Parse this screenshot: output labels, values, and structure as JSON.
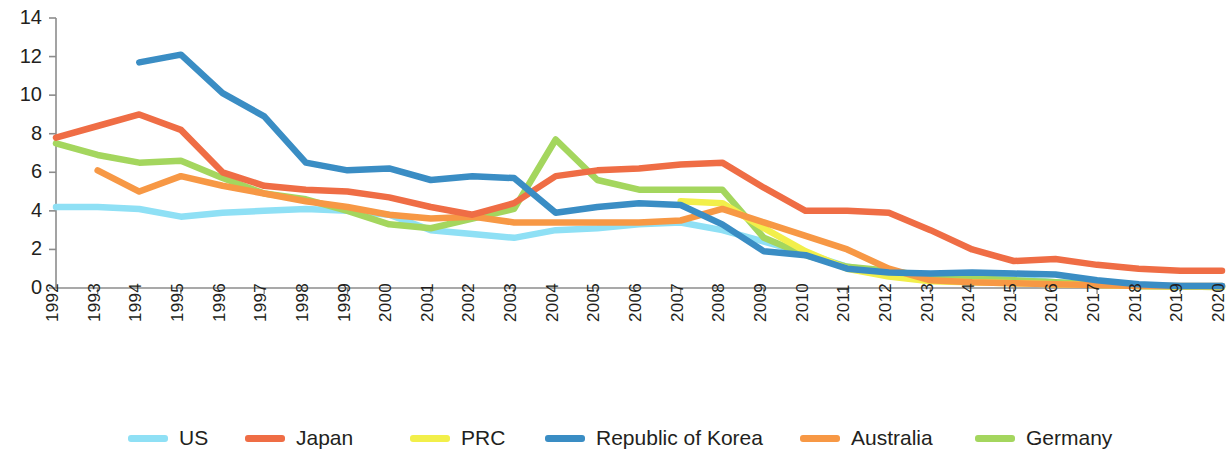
{
  "chart_data": {
    "type": "line",
    "title": "",
    "xlabel": "",
    "ylabel": "",
    "grid": false,
    "legend_position": "bottom",
    "ylim": [
      0,
      14
    ],
    "yticks": [
      0,
      2,
      4,
      6,
      8,
      10,
      12,
      14
    ],
    "categories": [
      "1992",
      "1993",
      "1994",
      "1995",
      "1996",
      "1997",
      "1998",
      "1999",
      "2000",
      "2001",
      "2002",
      "2003",
      "2004",
      "2005",
      "2006",
      "2007",
      "2008",
      "2009",
      "2010",
      "2011",
      "2012",
      "2013",
      "2014",
      "2015",
      "2016",
      "2017",
      "2018",
      "2019",
      "2020"
    ],
    "series": [
      {
        "name": "US",
        "color": "#8FE0F5",
        "values": [
          4.2,
          4.2,
          4.1,
          3.7,
          3.9,
          4.0,
          4.1,
          4.0,
          3.8,
          3.0,
          2.8,
          2.6,
          3.0,
          3.1,
          3.3,
          3.4,
          3.0,
          2.4,
          1.8,
          1.1,
          0.8,
          0.7,
          0.7,
          0.5,
          0.3,
          0.2,
          0.1,
          0.1,
          0.1
        ]
      },
      {
        "name": "Japan",
        "color": "#EF6D45",
        "values": [
          7.8,
          8.4,
          9.0,
          8.2,
          6.0,
          5.3,
          5.1,
          5.0,
          4.7,
          4.2,
          3.8,
          4.4,
          5.8,
          6.1,
          6.2,
          6.4,
          6.5,
          5.2,
          4.0,
          4.0,
          3.9,
          3.0,
          2.0,
          1.4,
          1.5,
          1.2,
          1.0,
          0.9,
          0.9
        ]
      },
      {
        "name": "PRC",
        "color": "#F2EF4A",
        "values": [
          null,
          null,
          null,
          null,
          null,
          null,
          null,
          null,
          null,
          null,
          null,
          null,
          null,
          null,
          null,
          4.5,
          4.4,
          3.1,
          1.9,
          1.0,
          0.6,
          0.35,
          0.3,
          0.25,
          0.2,
          0.15,
          0.1,
          0.08,
          0.05
        ]
      },
      {
        "name": "Republic of Korea",
        "color": "#3A8DC4",
        "values": [
          null,
          null,
          11.7,
          12.1,
          10.1,
          8.9,
          6.5,
          6.1,
          6.2,
          5.6,
          5.8,
          5.7,
          3.9,
          4.2,
          4.4,
          4.3,
          3.3,
          1.9,
          1.7,
          1.0,
          0.8,
          0.75,
          0.8,
          0.75,
          0.7,
          0.4,
          0.2,
          0.1,
          0.1
        ]
      },
      {
        "name": "Australia",
        "color": "#F79845",
        "values": [
          null,
          6.1,
          5.0,
          5.8,
          5.3,
          4.9,
          4.5,
          4.2,
          3.8,
          3.6,
          3.7,
          3.4,
          3.4,
          3.4,
          3.4,
          3.5,
          4.1,
          3.4,
          2.7,
          2.0,
          1.0,
          0.4,
          0.3,
          0.25,
          0.2,
          0.15,
          0.1,
          0.1,
          0.1
        ]
      },
      {
        "name": "Germany",
        "color": "#A4D65E",
        "values": [
          7.5,
          6.9,
          6.5,
          6.6,
          5.7,
          4.9,
          4.6,
          4.0,
          3.3,
          3.1,
          3.6,
          4.1,
          7.7,
          5.6,
          5.1,
          5.1,
          5.1,
          2.6,
          1.7,
          1.1,
          0.9,
          0.6,
          0.5,
          0.4,
          0.3,
          0.2,
          0.1,
          0.08,
          0.05
        ]
      }
    ]
  },
  "legend": {
    "items": [
      {
        "label": "US",
        "color": "#8FE0F5"
      },
      {
        "label": "Japan",
        "color": "#EF6D45"
      },
      {
        "label": "PRC",
        "color": "#F2EF4A"
      },
      {
        "label": "Republic of Korea",
        "color": "#3A8DC4"
      },
      {
        "label": "Australia",
        "color": "#F79845"
      },
      {
        "label": "Germany",
        "color": "#A4D65E"
      }
    ]
  },
  "axis": {
    "color": "#8c8c8c"
  }
}
